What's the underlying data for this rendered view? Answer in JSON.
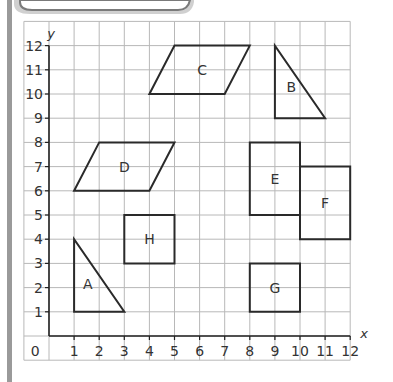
{
  "diagram": {
    "type": "coordinate-grid",
    "x_axis": {
      "label": "x",
      "min": 0,
      "max": 12,
      "ticks": [
        "1",
        "2",
        "3",
        "4",
        "5",
        "6",
        "7",
        "8",
        "9",
        "10",
        "11",
        "12"
      ],
      "origin_label": "0"
    },
    "y_axis": {
      "label": "y",
      "min": 0,
      "max": 12,
      "ticks": [
        "1",
        "2",
        "3",
        "4",
        "5",
        "6",
        "7",
        "8",
        "9",
        "10",
        "11",
        "12"
      ]
    },
    "grid": {
      "visible": true,
      "color": "#b8b8b8"
    },
    "shape_color": "#2a2a2a",
    "shapes": [
      {
        "label": "A",
        "kind": "triangle",
        "points": [
          [
            1,
            1
          ],
          [
            1,
            4
          ],
          [
            3,
            1
          ]
        ],
        "label_pos": [
          1.55,
          2.15
        ]
      },
      {
        "label": "B",
        "kind": "triangle",
        "points": [
          [
            9,
            12
          ],
          [
            9,
            9
          ],
          [
            11,
            9
          ]
        ],
        "label_pos": [
          9.65,
          10.3
        ]
      },
      {
        "label": "C",
        "kind": "parallelogram",
        "points": [
          [
            4,
            10
          ],
          [
            5,
            12
          ],
          [
            8,
            12
          ],
          [
            7,
            10
          ]
        ],
        "label_pos": [
          6.1,
          11.0
        ]
      },
      {
        "label": "D",
        "kind": "parallelogram",
        "points": [
          [
            1,
            6
          ],
          [
            2,
            8
          ],
          [
            5,
            8
          ],
          [
            4,
            6
          ]
        ],
        "label_pos": [
          3.0,
          7.0
        ]
      },
      {
        "label": "E",
        "kind": "rectangle",
        "points": [
          [
            8,
            5
          ],
          [
            8,
            8
          ],
          [
            10,
            8
          ],
          [
            10,
            5
          ]
        ],
        "label_pos": [
          9.0,
          6.5
        ]
      },
      {
        "label": "F",
        "kind": "rectangle",
        "points": [
          [
            10,
            4
          ],
          [
            10,
            7
          ],
          [
            12,
            7
          ],
          [
            12,
            4
          ]
        ],
        "label_pos": [
          11.0,
          5.5
        ]
      },
      {
        "label": "G",
        "kind": "rectangle",
        "points": [
          [
            8,
            1
          ],
          [
            8,
            3
          ],
          [
            10,
            3
          ],
          [
            10,
            1
          ]
        ],
        "label_pos": [
          9.0,
          2.0
        ]
      },
      {
        "label": "H",
        "kind": "square",
        "points": [
          [
            3,
            3
          ],
          [
            3,
            5
          ],
          [
            5,
            5
          ],
          [
            5,
            3
          ]
        ],
        "label_pos": [
          4.0,
          4.0
        ]
      }
    ]
  }
}
